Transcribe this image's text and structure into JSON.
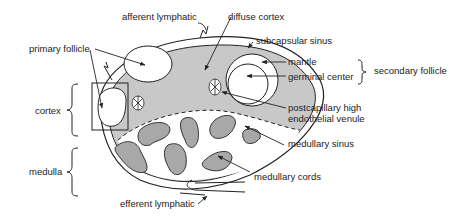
{
  "diagram": {
    "colors": {
      "background": "#ffffff",
      "cortex_fill": "#c8c8c8",
      "cords_fill": "#a8a8a8",
      "outline": "#222222"
    },
    "labels": {
      "afferent_lymphatic": "afferent lymphatic",
      "diffuse_cortex": "diffuse cortex",
      "primary_follicle": "primary follicle",
      "subcapsular_sinus": "subcapsular sinus",
      "mantle": "mantle",
      "germinal_center": "germinal center",
      "secondary_follicle": "secondary follicle",
      "cortex": "cortex",
      "postcapillary_line1": "postcapillary high",
      "postcapillary_line2": "endothelial venule",
      "medullary_sinus": "medullary sinus",
      "medulla": "medulla",
      "medullary_cords": "medullary cords",
      "efferent_lymphatic": "efferent lymphatic"
    }
  }
}
